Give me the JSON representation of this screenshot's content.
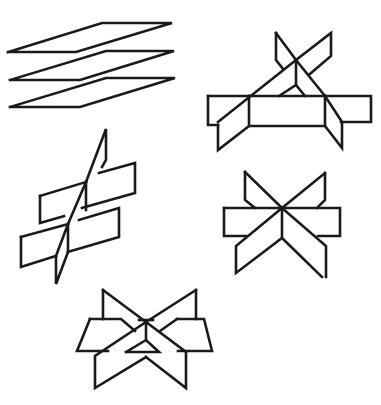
{
  "diagram": {
    "stroke_color": "#1a1a1a",
    "background": "#ffffff",
    "figures": [
      {
        "id": "parallel-planes",
        "label": "three parallel planes",
        "polylines": [
          [
            [
              8,
              52
            ],
            [
              76,
              52
            ],
            [
              172,
              23
            ],
            [
              102,
              23
            ],
            [
              8,
              52
            ]
          ],
          [
            [
              10,
              80
            ],
            [
              80,
              80
            ],
            [
              174,
              51
            ],
            [
              106,
              51
            ],
            [
              10,
              80
            ]
          ],
          [
            [
              10,
              107
            ],
            [
              80,
              107
            ],
            [
              175,
              78
            ],
            [
              106,
              78
            ],
            [
              10,
              107
            ]
          ]
        ]
      },
      {
        "id": "two-crossing-planes-on-horizontal",
        "label": "two intersecting planes cutting a third plane",
        "polylines": [
          [
            [
              208,
              96
            ],
            [
              249,
              96
            ]
          ],
          [
            [
              325,
              96
            ],
            [
              371,
              96
            ],
            [
              371,
              122
            ],
            [
              341,
              122
            ]
          ],
          [
            [
              208,
              96
            ],
            [
              208,
              125
            ],
            [
              218,
              125
            ]
          ],
          [
            [
              249,
              96
            ],
            [
              325,
              96
            ]
          ],
          [
            [
              249,
              96
            ],
            [
              249,
              126
            ],
            [
              325,
              126
            ],
            [
              325,
              96
            ]
          ],
          [
            [
              218,
              125
            ],
            [
              218,
              150
            ],
            [
              249,
              126
            ]
          ],
          [
            [
              325,
              126
            ],
            [
              342,
              148
            ],
            [
              342,
              122
            ],
            [
              325,
              96
            ]
          ],
          [
            [
              218,
              122
            ],
            [
              296,
              60
            ],
            [
              331,
              33
            ],
            [
              331,
              56
            ],
            [
              310,
              74
            ]
          ],
          [
            [
              276,
              33
            ],
            [
              276,
              60
            ],
            [
              283,
              69
            ]
          ],
          [
            [
              276,
              33
            ],
            [
              296,
              60
            ],
            [
              325,
              96
            ]
          ],
          [
            [
              296,
              60
            ],
            [
              296,
              85
            ]
          ],
          [
            [
              279,
              96
            ],
            [
              296,
              85
            ],
            [
              305,
              96
            ]
          ]
        ]
      },
      {
        "id": "two-parallel-cut-by-third",
        "label": "two parallel planes cut by a third plane",
        "polylines": [
          [
            [
              40,
              196
            ],
            [
              86,
              182
            ]
          ],
          [
            [
              99,
              173
            ],
            [
              135,
              163
            ],
            [
              135,
              193
            ],
            [
              82,
              208
            ]
          ],
          [
            [
              40,
              196
            ],
            [
              40,
              223
            ],
            [
              64,
              216
            ]
          ],
          [
            [
              86,
              182
            ],
            [
              106,
              129
            ],
            [
              106,
              160
            ],
            [
              102,
              167
            ]
          ],
          [
            [
              86,
              182
            ],
            [
              86,
              210
            ]
          ],
          [
            [
              21,
              237
            ],
            [
              68,
              224
            ]
          ],
          [
            [
              79,
              220
            ],
            [
              119,
              208
            ],
            [
              119,
              237
            ],
            [
              68,
              252
            ]
          ],
          [
            [
              21,
              237
            ],
            [
              21,
              267
            ],
            [
              56,
              256
            ]
          ],
          [
            [
              68,
              224
            ],
            [
              56,
              256
            ],
            [
              56,
              284
            ],
            [
              68,
              252
            ],
            [
              68,
              224
            ]
          ],
          [
            [
              86,
              182
            ],
            [
              68,
              224
            ]
          ]
        ]
      },
      {
        "id": "three-planes-common-line",
        "label": "three planes sharing a common line",
        "polylines": [
          [
            [
              224,
              208
            ],
            [
              340,
              208
            ],
            [
              340,
              236
            ],
            [
              318,
              236
            ]
          ],
          [
            [
              224,
              208
            ],
            [
              224,
              236
            ],
            [
              246,
              236
            ]
          ],
          [
            [
              245,
              172
            ],
            [
              245,
              200
            ],
            [
              255,
              208
            ]
          ],
          [
            [
              245,
              172
            ],
            [
              282,
              208
            ],
            [
              326,
              246
            ],
            [
              326,
              277
            ]
          ],
          [
            [
              325,
              173
            ],
            [
              325,
              200
            ],
            [
              317,
              208
            ]
          ],
          [
            [
              325,
              173
            ],
            [
              282,
              208
            ],
            [
              236,
              246
            ],
            [
              236,
              273
            ],
            [
              282,
              238
            ],
            [
              322,
              277
            ]
          ],
          [
            [
              282,
              208
            ],
            [
              282,
              238
            ]
          ]
        ]
      },
      {
        "id": "three-planes-triangular-prism",
        "label": "three planes forming a triangular prism",
        "polylines": [
          [
            [
              103,
              290
            ],
            [
              103,
              319
            ]
          ],
          [
            [
              90,
              319
            ],
            [
              121,
              319
            ],
            [
              135,
              331
            ]
          ],
          [
            [
              90,
              319
            ],
            [
              77,
              351
            ],
            [
              108,
              351
            ]
          ],
          [
            [
              103,
              290
            ],
            [
              146,
              322
            ],
            [
              186,
              352
            ],
            [
              186,
              388
            ],
            [
              146,
              357
            ]
          ],
          [
            [
              196,
              290
            ],
            [
              196,
              319
            ]
          ],
          [
            [
              177,
              319
            ],
            [
              204,
              319
            ],
            [
              212,
              351
            ],
            [
              178,
              351
            ]
          ],
          [
            [
              196,
              290
            ],
            [
              146,
              322
            ],
            [
              95,
              356
            ],
            [
              95,
              388
            ],
            [
              146,
              357
            ]
          ],
          [
            [
              160,
              331
            ],
            [
              177,
              319
            ]
          ],
          [
            [
              146,
              322
            ],
            [
              146,
              340
            ]
          ],
          [
            [
              126,
              352
            ],
            [
              146,
              340
            ],
            [
              159,
              352
            ],
            [
              126,
              352
            ]
          ],
          [
            [
              139,
              320
            ],
            [
              153,
              320
            ]
          ]
        ]
      }
    ]
  }
}
